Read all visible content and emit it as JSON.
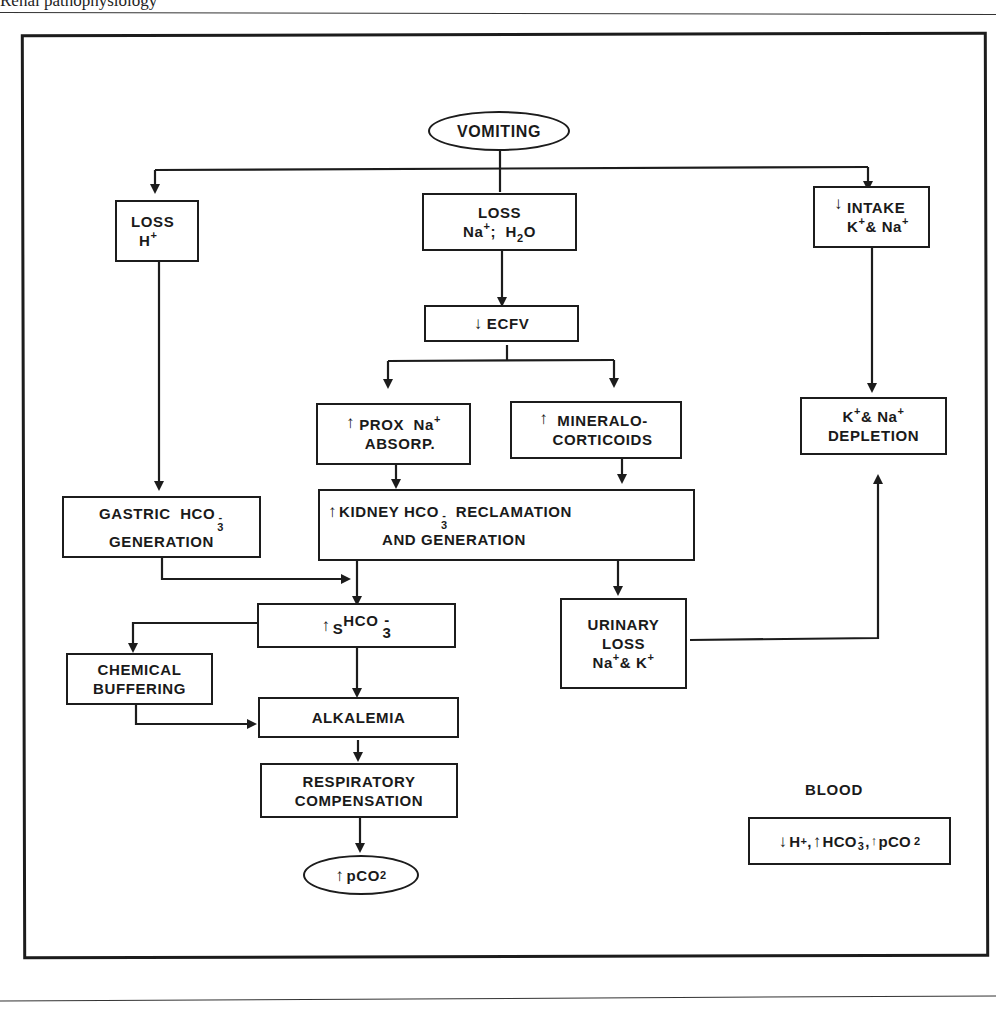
{
  "page": {
    "running_head": "Renal pathophysiology"
  },
  "diagram": {
    "title": "",
    "nodes": {
      "vomiting": {
        "text": "VOMITING"
      },
      "loss_h": {
        "line1": "LOSS",
        "line2_base": "H",
        "line2_sup": "+"
      },
      "loss_na_h2o": {
        "line1": "LOSS",
        "na": "Na",
        "na_sup": "+",
        "sep": ";",
        "h2o_h": "H",
        "h2o_sub": "2",
        "h2o_o": "O"
      },
      "decreased_intake": {
        "arrow": "↓",
        "line1": "INTAKE",
        "k": "K",
        "k_sup": "+",
        "amp": "&",
        "na": "Na",
        "na_sup": "+"
      },
      "decreased_ecfv": {
        "arrow": "↓",
        "text": "ECFV"
      },
      "prox_na_absorp": {
        "arrow": "↑",
        "line1": "PROX  Na",
        "line1_sup": "+",
        "line2": "ABSORP."
      },
      "mineralocorticoids": {
        "arrow": "↑",
        "line1": "MINERALO-",
        "line2": "CORTICOIDS"
      },
      "k_na_depletion": {
        "k": "K",
        "k_sup": "+",
        "amp": "&",
        "na": "Na",
        "na_sup": "+",
        "line2": "DEPLETION"
      },
      "gastric_hco3": {
        "line1": "GASTRIC  HCO",
        "sub": "3",
        "sup": "-",
        "line2": "GENERATION"
      },
      "kidney_hco3": {
        "arrow": "↑",
        "line1_a": "KIDNEY HCO",
        "sub": "3",
        "sup": "-",
        "line1_b": "RECLAMATION",
        "line2": "AND GENERATION"
      },
      "serum_hco3": {
        "arrow": "↑",
        "s": "S",
        "hco": "HCO",
        "sup": "-",
        "sub": "3"
      },
      "urinary_loss": {
        "line1": "URINARY",
        "line2": "LOSS",
        "na": "Na",
        "na_sup": "+",
        "amp": "&",
        "k": "K",
        "k_sup": "+"
      },
      "chemical_buffering": {
        "line1": "CHEMICAL",
        "line2": "BUFFERING"
      },
      "alkalemia": {
        "text": "ALKALEMIA"
      },
      "respiratory_compensation": {
        "line1": "RESPIRATORY",
        "line2": "COMPENSATION"
      },
      "increased_pco2": {
        "arrow": "↑",
        "text": "pCO",
        "sub": "2"
      }
    },
    "legend": {
      "title": "BLOOD",
      "h_arrow": "↓",
      "h": "H",
      "h_sup": "+",
      "hco3_arrow": "↑",
      "hco3": "HCO",
      "hco3_sub": "3",
      "hco3_sup": "-",
      "pco2_arrow": "↑",
      "pco2": "pCO",
      "pco2_sub": "2",
      "comma": ","
    },
    "edges": [
      [
        "vomiting",
        "loss_h"
      ],
      [
        "vomiting",
        "loss_na_h2o"
      ],
      [
        "vomiting",
        "decreased_intake"
      ],
      [
        "loss_na_h2o",
        "decreased_ecfv"
      ],
      [
        "decreased_ecfv",
        "prox_na_absorp"
      ],
      [
        "decreased_ecfv",
        "mineralocorticoids"
      ],
      [
        "decreased_intake",
        "k_na_depletion"
      ],
      [
        "loss_h",
        "gastric_hco3"
      ],
      [
        "prox_na_absorp",
        "kidney_hco3"
      ],
      [
        "mineralocorticoids",
        "kidney_hco3"
      ],
      [
        "gastric_hco3",
        "serum_hco3"
      ],
      [
        "kidney_hco3",
        "serum_hco3"
      ],
      [
        "kidney_hco3",
        "urinary_loss"
      ],
      [
        "urinary_loss",
        "k_na_depletion"
      ],
      [
        "serum_hco3",
        "chemical_buffering"
      ],
      [
        "serum_hco3",
        "alkalemia"
      ],
      [
        "chemical_buffering",
        "alkalemia"
      ],
      [
        "alkalemia",
        "respiratory_compensation"
      ],
      [
        "respiratory_compensation",
        "increased_pco2"
      ]
    ]
  }
}
